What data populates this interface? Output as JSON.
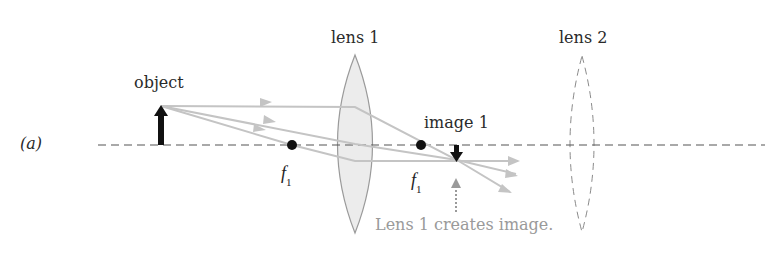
{
  "figure": {
    "panel_label": "(a)",
    "labels": {
      "lens1": "lens 1",
      "lens2": "lens 2",
      "object": "object",
      "image1": "image 1",
      "focal_left": "f",
      "focal_left_sub": "1",
      "focal_right": "f",
      "focal_right_sub": "1",
      "caption": "Lens 1 creates image."
    },
    "colors": {
      "axis": "#555555",
      "ray": "#c4c4c4",
      "lens1_fill": "#ececec",
      "lens1_stroke": "#9a9a9a",
      "lens2_stroke": "#8a8a8a",
      "arrow": "#111111",
      "caption_arrow": "#9a9a9a",
      "caption_text": "#9a9a9a"
    }
  }
}
